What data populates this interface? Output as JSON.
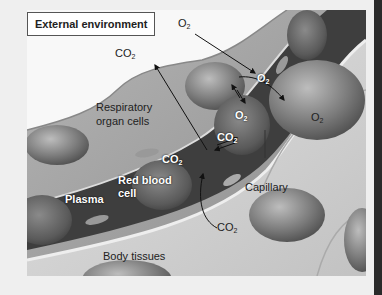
{
  "diagram": {
    "title": "External environment",
    "labels": {
      "o2_external": "O",
      "co2_external": "CO",
      "respiratory_cells": "Respiratory",
      "respiratory_cells_2": "organ cells",
      "o2_capillary_1": "O",
      "o2_capillary_2": "O",
      "co2_capillary_1": "CO",
      "co2_capillary_2": "CO",
      "o2_tissue": "O",
      "co2_tissue": "CO",
      "red_blood_cell": "Red blood",
      "red_blood_cell_2": "cell",
      "plasma": "Plasma",
      "capillary": "Capillary",
      "body_tissues": "Body tissues",
      "subscript_2": "2"
    },
    "colors": {
      "background": "#efefef",
      "panel": "#f8f8f8",
      "cell_dark": "#6a6a6a",
      "cell_light": "#d8d8d8",
      "capillary_dark": "#3a3a3a",
      "border_right": "#2a2a2a"
    }
  }
}
